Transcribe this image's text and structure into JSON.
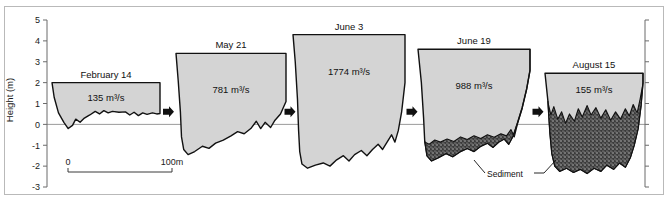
{
  "figure": {
    "background_color": "#ffffff",
    "frame_color": "#b9b9b9",
    "water_fill_color": "#d4d4d4",
    "sediment_fill_color": "#3a3a3a",
    "outline_color": "#111111",
    "waterline_color": "#9a9a9a"
  },
  "yaxis": {
    "title": "Height (m)",
    "ticks": [
      "5",
      "4",
      "3",
      "2",
      "1",
      "0",
      "-1",
      "-2",
      "-3"
    ],
    "tick_values": [
      5,
      4,
      3,
      2,
      1,
      0,
      -1,
      -2,
      -3
    ],
    "range": [
      -3,
      5
    ],
    "unit": "m"
  },
  "scalebar": {
    "start_label": "0",
    "end_label": "100m",
    "length_m": 100
  },
  "annotations": {
    "sediment_label": "Sediment",
    "flow_arrow_name": "right-arrow"
  },
  "chart_data": {
    "type": "area",
    "title": "",
    "xlabel": "",
    "ylabel": "Height (m)",
    "ylim": [
      -3,
      5
    ],
    "grid": false,
    "legend": "none",
    "panels": [
      {
        "id": "february-14",
        "date": "February 14",
        "discharge": "135 m³/s",
        "discharge_value": 135,
        "bank_top_m": 2.0,
        "channel_bottom_m": -0.25,
        "has_sediment": false,
        "water_surface_outline": [
          [
            0.0,
            2.0
          ],
          [
            0.02,
            1.3
          ],
          [
            0.06,
            0.55
          ],
          [
            0.11,
            0.1
          ],
          [
            0.15,
            -0.2
          ],
          [
            0.19,
            -0.05
          ],
          [
            0.22,
            0.25
          ],
          [
            0.26,
            0.1
          ],
          [
            0.3,
            0.3
          ],
          [
            0.35,
            0.45
          ],
          [
            0.4,
            0.62
          ],
          [
            0.44,
            0.5
          ],
          [
            0.48,
            0.66
          ],
          [
            0.52,
            0.55
          ],
          [
            0.56,
            0.62
          ],
          [
            0.62,
            0.58
          ],
          [
            0.68,
            0.6
          ],
          [
            0.72,
            0.45
          ],
          [
            0.76,
            0.58
          ],
          [
            0.8,
            0.42
          ],
          [
            0.84,
            0.55
          ],
          [
            0.88,
            0.48
          ],
          [
            0.93,
            0.55
          ],
          [
            0.97,
            0.5
          ],
          [
            1.0,
            0.52
          ],
          [
            1.0,
            2.0
          ]
        ]
      },
      {
        "id": "may-21",
        "date": "May 21",
        "discharge": "781 m³/s",
        "discharge_value": 781,
        "bank_top_m": 3.4,
        "channel_bottom_m": -1.45,
        "has_sediment": false,
        "water_surface_outline": [
          [
            0.0,
            3.4
          ],
          [
            0.02,
            2.1
          ],
          [
            0.04,
            0.6
          ],
          [
            0.05,
            -0.6
          ],
          [
            0.07,
            -1.2
          ],
          [
            0.11,
            -1.45
          ],
          [
            0.17,
            -1.3
          ],
          [
            0.24,
            -1.05
          ],
          [
            0.3,
            -1.15
          ],
          [
            0.36,
            -0.9
          ],
          [
            0.43,
            -0.75
          ],
          [
            0.5,
            -0.55
          ],
          [
            0.56,
            -0.35
          ],
          [
            0.62,
            -0.45
          ],
          [
            0.68,
            -0.2
          ],
          [
            0.73,
            0.15
          ],
          [
            0.77,
            -0.2
          ],
          [
            0.81,
            0.1
          ],
          [
            0.86,
            -0.15
          ],
          [
            0.9,
            0.2
          ],
          [
            0.95,
            0.5
          ],
          [
            1.0,
            1.1
          ],
          [
            1.0,
            3.4
          ]
        ]
      },
      {
        "id": "june-3",
        "date": "June 3",
        "discharge": "1774 m³/s",
        "discharge_value": 1774,
        "bank_top_m": 4.3,
        "channel_bottom_m": -2.1,
        "has_sediment": false,
        "water_surface_outline": [
          [
            0.0,
            4.3
          ],
          [
            0.02,
            3.0
          ],
          [
            0.04,
            1.2
          ],
          [
            0.05,
            -0.3
          ],
          [
            0.06,
            -1.3
          ],
          [
            0.08,
            -1.9
          ],
          [
            0.13,
            -2.1
          ],
          [
            0.2,
            -1.95
          ],
          [
            0.27,
            -1.85
          ],
          [
            0.33,
            -2.0
          ],
          [
            0.39,
            -1.7
          ],
          [
            0.45,
            -1.5
          ],
          [
            0.5,
            -1.75
          ],
          [
            0.55,
            -1.45
          ],
          [
            0.61,
            -1.25
          ],
          [
            0.66,
            -1.5
          ],
          [
            0.71,
            -1.2
          ],
          [
            0.76,
            -0.95
          ],
          [
            0.8,
            -1.2
          ],
          [
            0.84,
            -0.85
          ],
          [
            0.88,
            -0.5
          ],
          [
            0.91,
            -0.85
          ],
          [
            0.94,
            -0.3
          ],
          [
            0.97,
            0.6
          ],
          [
            1.0,
            2.0
          ],
          [
            1.0,
            4.3
          ]
        ]
      },
      {
        "id": "june-19",
        "date": "June 19",
        "discharge": "988 m³/s",
        "discharge_value": 988,
        "bank_top_m": 3.6,
        "channel_bottom_m": -1.95,
        "has_sediment": true,
        "water_surface_outline": [
          [
            0.0,
            3.6
          ],
          [
            0.03,
            2.0
          ],
          [
            0.05,
            0.3
          ],
          [
            0.06,
            -0.8
          ],
          [
            0.08,
            -1.5
          ],
          [
            0.12,
            -1.75
          ],
          [
            0.18,
            -1.6
          ],
          [
            0.25,
            -1.4
          ],
          [
            0.31,
            -1.55
          ],
          [
            0.38,
            -1.3
          ],
          [
            0.44,
            -1.15
          ],
          [
            0.5,
            -1.3
          ],
          [
            0.56,
            -1.05
          ],
          [
            0.62,
            -0.9
          ],
          [
            0.67,
            -1.1
          ],
          [
            0.72,
            -0.85
          ],
          [
            0.77,
            -0.7
          ],
          [
            0.81,
            -0.95
          ],
          [
            0.85,
            -0.55
          ],
          [
            0.89,
            0.1
          ],
          [
            0.93,
            0.8
          ],
          [
            0.97,
            1.7
          ],
          [
            1.0,
            2.6
          ],
          [
            1.0,
            3.6
          ]
        ],
        "sediment_top_outline": [
          [
            0.06,
            -0.85
          ],
          [
            0.1,
            -0.95
          ],
          [
            0.15,
            -0.75
          ],
          [
            0.2,
            -0.85
          ],
          [
            0.26,
            -0.7
          ],
          [
            0.32,
            -0.82
          ],
          [
            0.38,
            -0.6
          ],
          [
            0.44,
            -0.72
          ],
          [
            0.5,
            -0.55
          ],
          [
            0.56,
            -0.68
          ],
          [
            0.62,
            -0.5
          ],
          [
            0.68,
            -0.62
          ],
          [
            0.74,
            -0.45
          ],
          [
            0.79,
            -0.55
          ],
          [
            0.83,
            -0.25
          ],
          [
            0.86,
            -0.6
          ],
          [
            0.89,
            0.05
          ],
          [
            0.93,
            0.75
          ],
          [
            0.97,
            1.65
          ],
          [
            1.0,
            2.55
          ]
        ]
      },
      {
        "id": "august-15",
        "date": "August 15",
        "discharge": "155 m³/s",
        "discharge_value": 155,
        "bank_top_m": 2.45,
        "channel_bottom_m": -2.35,
        "has_sediment": true,
        "water_surface_outline": [
          [
            0.0,
            2.45
          ],
          [
            0.03,
            1.1
          ],
          [
            0.05,
            -0.4
          ],
          [
            0.07,
            -1.4
          ],
          [
            0.1,
            -2.0
          ],
          [
            0.15,
            -2.25
          ],
          [
            0.22,
            -2.1
          ],
          [
            0.29,
            -2.3
          ],
          [
            0.36,
            -2.15
          ],
          [
            0.43,
            -2.35
          ],
          [
            0.5,
            -2.1
          ],
          [
            0.57,
            -2.25
          ],
          [
            0.63,
            -1.95
          ],
          [
            0.7,
            -2.15
          ],
          [
            0.76,
            -1.85
          ],
          [
            0.82,
            -2.05
          ],
          [
            0.87,
            -1.6
          ],
          [
            0.91,
            -1.0
          ],
          [
            0.95,
            -0.2
          ],
          [
            0.98,
            0.9
          ],
          [
            1.0,
            2.0
          ],
          [
            1.0,
            2.45
          ]
        ],
        "sediment_top_outline": [
          [
            0.03,
            1.05
          ],
          [
            0.06,
            0.45
          ],
          [
            0.09,
            0.85
          ],
          [
            0.13,
            0.25
          ],
          [
            0.17,
            0.6
          ],
          [
            0.21,
            0.05
          ],
          [
            0.25,
            0.5
          ],
          [
            0.3,
            0.15
          ],
          [
            0.34,
            0.75
          ],
          [
            0.38,
            0.35
          ],
          [
            0.43,
            0.9
          ],
          [
            0.47,
            0.45
          ],
          [
            0.52,
            0.8
          ],
          [
            0.57,
            0.3
          ],
          [
            0.62,
            0.7
          ],
          [
            0.67,
            0.2
          ],
          [
            0.72,
            0.6
          ],
          [
            0.77,
            0.25
          ],
          [
            0.82,
            0.75
          ],
          [
            0.86,
            0.4
          ],
          [
            0.9,
            0.95
          ],
          [
            0.94,
            0.55
          ],
          [
            0.97,
            1.2
          ],
          [
            1.0,
            1.95
          ]
        ]
      }
    ]
  }
}
